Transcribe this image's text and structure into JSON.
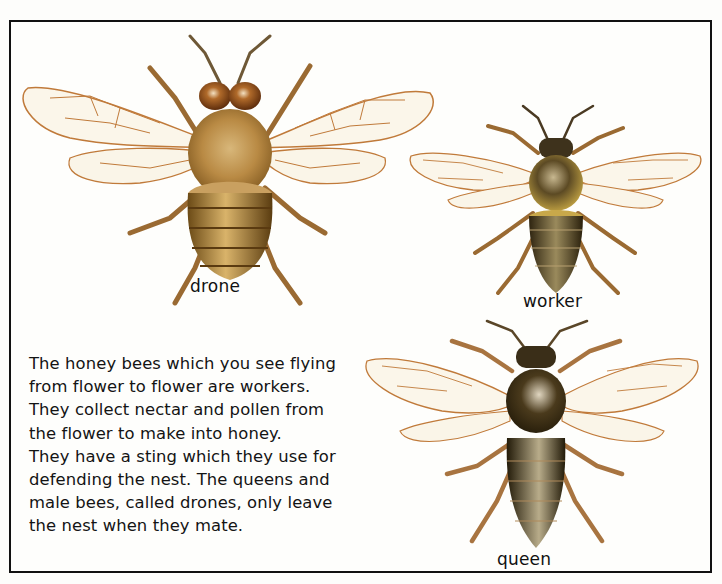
{
  "page": {
    "colors": {
      "frame_border": "#111111",
      "background": "#fefefc",
      "text": "#141414",
      "wing_vein": "#c07a3a",
      "drone_body": "#b8863c",
      "worker_body": "#4a3a1c",
      "queen_body": "#3e3118"
    }
  },
  "illustrations": {
    "drone": {
      "label": "drone",
      "icon": "drone-bee-illustration"
    },
    "worker": {
      "label": "worker",
      "icon": "worker-bee-illustration"
    },
    "queen": {
      "label": "queen",
      "icon": "queen-bee-illustration"
    }
  },
  "body_text": {
    "lines": [
      "The honey bees which you see flying",
      "from flower to flower are workers.",
      "They collect nectar and pollen from",
      "the flower to make into honey.",
      "They have a sting which they use for",
      "defending the nest. The queens and",
      "male bees, called drones, only leave",
      "the nest when they mate."
    ]
  }
}
